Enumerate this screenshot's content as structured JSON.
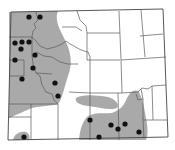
{
  "map": {
    "region": "Wyoming",
    "description": "Distribution map with shaded range and occurrence dots, county boundaries shown",
    "colors": {
      "range": "#a9a9a9",
      "dot": "#111111",
      "border": "#444444",
      "county": "#5a5a5a"
    },
    "occurrences": [
      {
        "x": 29,
        "y": 17
      },
      {
        "x": 40,
        "y": 17
      },
      {
        "x": 15,
        "y": 43
      },
      {
        "x": 22,
        "y": 42
      },
      {
        "x": 29,
        "y": 42
      },
      {
        "x": 21,
        "y": 49
      },
      {
        "x": 35,
        "y": 55
      },
      {
        "x": 15,
        "y": 60
      },
      {
        "x": 33,
        "y": 68
      },
      {
        "x": 22,
        "y": 79
      },
      {
        "x": 55,
        "y": 83
      },
      {
        "x": 58,
        "y": 96
      },
      {
        "x": 24,
        "y": 137
      },
      {
        "x": 90,
        "y": 120
      },
      {
        "x": 111,
        "y": 125
      },
      {
        "x": 118,
        "y": 129
      },
      {
        "x": 125,
        "y": 124
      },
      {
        "x": 99,
        "y": 137
      },
      {
        "x": 139,
        "y": 132
      }
    ]
  }
}
